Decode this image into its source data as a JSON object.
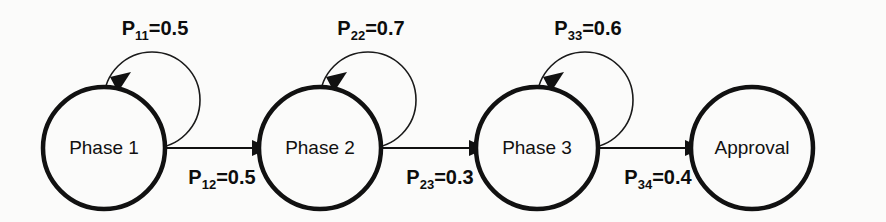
{
  "diagram": {
    "type": "state-transition-markov-chain",
    "title": "",
    "background_color": "#fbfbfa",
    "stroke_color": "#111111",
    "nodes": [
      {
        "id": "phase1",
        "label": "Phase 1",
        "cx": 104,
        "cy": 148,
        "r": 61,
        "has_self_loop": true
      },
      {
        "id": "phase2",
        "label": "Phase 2",
        "cx": 320,
        "cy": 148,
        "r": 61,
        "has_self_loop": true
      },
      {
        "id": "phase3",
        "label": "Phase 3",
        "cx": 537,
        "cy": 148,
        "r": 61,
        "has_self_loop": true
      },
      {
        "id": "approval",
        "label": "Approval",
        "cx": 752,
        "cy": 148,
        "r": 61,
        "has_self_loop": false
      }
    ],
    "self_loops": [
      {
        "id": "p11",
        "node": "phase1",
        "symbol": "P",
        "subscript": "11",
        "equals": "=0.5",
        "value": 0.5,
        "label_x": 155,
        "label_y": 28
      },
      {
        "id": "p22",
        "node": "phase2",
        "symbol": "P",
        "subscript": "22",
        "equals": "=0.7",
        "value": 0.7,
        "label_x": 366,
        "label_y": 28
      },
      {
        "id": "p33",
        "node": "phase3",
        "symbol": "P",
        "subscript": "33",
        "equals": "=0.6",
        "value": 0.6,
        "label_x": 585,
        "label_y": 28
      }
    ],
    "transitions": [
      {
        "id": "p12",
        "from": "phase1",
        "to": "phase2",
        "symbol": "P",
        "subscript": "12",
        "equals": "=0.5",
        "value": 0.5,
        "label_x": 222,
        "label_y": 180
      },
      {
        "id": "p23",
        "from": "phase2",
        "to": "phase3",
        "symbol": "P",
        "subscript": "23",
        "equals": "=0.3",
        "value": 0.3,
        "label_x": 440,
        "label_y": 180
      },
      {
        "id": "p34",
        "from": "phase3",
        "to": "approval",
        "symbol": "P",
        "subscript": "34",
        "equals": "=0.4",
        "value": 0.4,
        "label_x": 658,
        "label_y": 180
      }
    ]
  }
}
